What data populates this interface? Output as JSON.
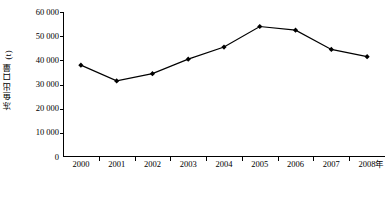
{
  "chart_data": {
    "type": "line",
    "title": "",
    "xlabel": "年",
    "ylabel": "冻鱼出口量 (t)",
    "categories": [
      "2000",
      "2001",
      "2002",
      "2003",
      "2004",
      "2005",
      "2006",
      "2007",
      "2008"
    ],
    "values": [
      38000,
      31500,
      34500,
      40500,
      45500,
      54000,
      52500,
      44500,
      41500
    ],
    "series": [
      {
        "name": "冻鱼出口量",
        "values": [
          38000,
          31500,
          34500,
          40500,
          45500,
          54000,
          52500,
          44500,
          41500
        ]
      }
    ],
    "ylim": [
      0,
      60000
    ],
    "y_ticks": [
      0,
      10000,
      20000,
      30000,
      40000,
      50000,
      60000
    ],
    "y_tick_labels": [
      "0",
      "10 000",
      "20 000",
      "30 000",
      "40 000",
      "50 000",
      "60 000"
    ],
    "grid": false,
    "legend": "none",
    "marker": "diamond",
    "line_color": "#000000",
    "marker_color": "#000000",
    "axis_color": "#000000",
    "background_color": "#ffffff"
  }
}
